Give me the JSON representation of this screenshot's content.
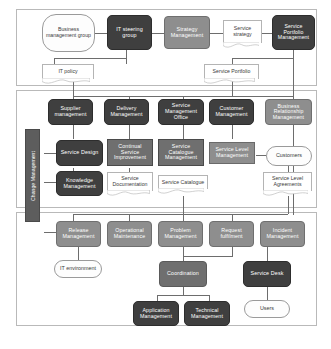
{
  "diagram": {
    "type": "layered-block-diagram",
    "colors": {
      "dark_node": "#3f3f3f",
      "mid_node": "#6f6f6f",
      "grey_node": "#8e8e8e",
      "pill_fill": "#fdfdfd",
      "document_fill": "#ffffff",
      "band_border": "#b9b9b9",
      "connector": "#6d6d6d",
      "vertical_bar": "#5d5d5d"
    }
  },
  "bands": {
    "strategy": {
      "name": "strategy-band"
    },
    "design": {
      "name": "design-band"
    },
    "operations": {
      "name": "operations-band"
    }
  },
  "vertical_bar": {
    "label": "Change Management"
  },
  "nodes": {
    "business_management_group": "Business management group",
    "it_steering_group": "IT steering group",
    "strategy_management": "Strategy Management",
    "service_strategy": "Service strategy",
    "service_portfolio_management": "Service Portfolio Management",
    "it_policy": "IT policy",
    "service_portfolio": "Service Portfolio",
    "supplier_management": "Supplier management",
    "delivery_management": "Delivery Management",
    "service_management_office": "Service Management Office",
    "customer_management": "Customer Management",
    "business_relationship_management": "Business Relationship Management",
    "service_design": "Service Design",
    "continual_service_improvement": "Continual Service Improvement",
    "service_catalogue_management": "Service Catalogue Management",
    "service_level_management": "Service Level Management",
    "customers": "Customers",
    "knowledge_management": "Knowledge Management",
    "service_documentation": "Service Documentation",
    "service_catalogue": "Service Catalogue",
    "service_level_agreements": "Service Level Agreements",
    "release_management": "Release Management",
    "operational_maintenance": "Operational Maintenance",
    "problem_management": "Problem Management",
    "request_fulfilment": "Request fulfilment",
    "incident_management": "Incident Management",
    "it_environment": "IT environment",
    "coordination": "Coordination",
    "service_desk": "Service Desk",
    "application_management": "Application Management",
    "technical_management": "Technical Management",
    "users": "Users"
  }
}
